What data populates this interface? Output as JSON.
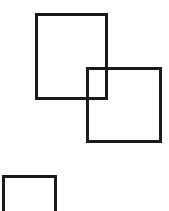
{
  "canvas": {
    "width": 169,
    "height": 211,
    "background": "#ffffff"
  },
  "shapes": [
    {
      "id": "rect-1",
      "type": "rectangle",
      "x": 35,
      "y": 13,
      "width": 73,
      "height": 87,
      "stroke": "#1a1a1a",
      "stroke_width": 3
    },
    {
      "id": "rect-2",
      "type": "rectangle",
      "x": 86,
      "y": 67,
      "width": 76,
      "height": 76,
      "stroke": "#1a1a1a",
      "stroke_width": 3
    },
    {
      "id": "rect-3",
      "type": "rectangle",
      "x": 2,
      "y": 175,
      "width": 55,
      "height": 45,
      "stroke": "#1a1a1a",
      "stroke_width": 3
    }
  ]
}
